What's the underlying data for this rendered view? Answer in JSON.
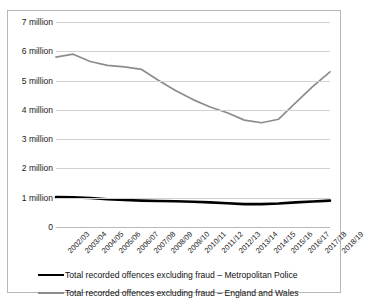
{
  "chart_data": {
    "type": "line",
    "title": "",
    "subtitle": "",
    "xlabel": "",
    "ylabel": "",
    "grid": true,
    "legend_position": "bottom",
    "ylim": [
      0,
      7000000
    ],
    "ytick_values": [
      0,
      1000000,
      2000000,
      3000000,
      4000000,
      5000000,
      6000000,
      7000000
    ],
    "ytick_labels": [
      "0",
      "1 million",
      "2 million",
      "3 million",
      "4 million",
      "5 million",
      "6 million",
      "7 million"
    ],
    "categories": [
      "2002/03",
      "2003/04",
      "2004/05",
      "2005/06",
      "2006/07",
      "2007/08",
      "2008/09",
      "2009/10",
      "2010/11",
      "2011/12",
      "2012/13",
      "2013/14",
      "2014/15",
      "2015/16",
      "2016/17",
      "2017/18",
      "2018/19"
    ],
    "series": [
      {
        "name": "Total recorded offences excluding fraud – Metropolitan Police",
        "color": "#000000",
        "width": 2.6,
        "values": [
          1020000,
          1010000,
          990000,
          950000,
          920000,
          900000,
          890000,
          880000,
          860000,
          840000,
          810000,
          780000,
          780000,
          800000,
          840000,
          870000,
          900000
        ]
      },
      {
        "name": "Total recorded offences excluding fraud – England and Wales",
        "color": "#8c8c8c",
        "width": 1.7,
        "values": [
          5800000,
          5900000,
          5650000,
          5520000,
          5470000,
          5380000,
          5000000,
          4650000,
          4350000,
          4100000,
          3900000,
          3650000,
          3560000,
          3680000,
          4250000,
          4800000,
          5300000
        ]
      }
    ]
  },
  "legend": {
    "entries": [
      {
        "label": "Total recorded offences excluding fraud – Metropolitan Police",
        "color": "#000000",
        "thickness": "2.6px"
      },
      {
        "label": "Total recorded offences excluding fraud – England and Wales",
        "color": "#8c8c8c",
        "thickness": "1.7px"
      }
    ]
  }
}
